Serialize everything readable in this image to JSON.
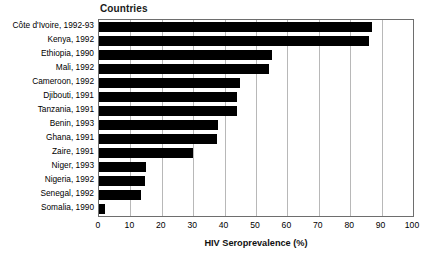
{
  "chart_data": {
    "type": "bar",
    "orientation": "horizontal",
    "title": "Countries",
    "xlabel": "HIV Seroprevalence (%)",
    "ylabel": "",
    "xlim": [
      0,
      100
    ],
    "xticks": [
      "0",
      "10",
      "20",
      "30",
      "40",
      "50",
      "60",
      "70",
      "80",
      "90",
      "100"
    ],
    "xtick_values": [
      0,
      10,
      20,
      30,
      40,
      50,
      60,
      70,
      80,
      90,
      100
    ],
    "grid": "vertical",
    "legend": "none",
    "bar_color": "#000000",
    "categories": [
      "Côte d'Ivoire, 1992-93",
      "Kenya, 1992",
      "Ethiopia, 1990",
      "Mali, 1992",
      "Cameroon, 1992",
      "Djibouti, 1991",
      "Tanzania, 1991",
      "Benin, 1993",
      "Ghana, 1991",
      "Zaire, 1991",
      "Niger, 1993",
      "Nigeria, 1992",
      "Senegal, 1992",
      "Somalia, 1990"
    ],
    "values": [
      87,
      86,
      55,
      54,
      45,
      44,
      44,
      38,
      37.5,
      30,
      15,
      14.5,
      13.5,
      2
    ]
  }
}
